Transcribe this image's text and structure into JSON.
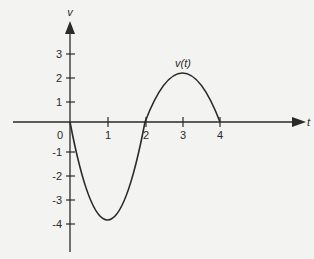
{
  "chart_data": {
    "type": "line",
    "title": "",
    "xlabel": "t",
    "ylabel": "v",
    "curve_label": "v(t)",
    "x_ticks": [
      "1",
      "2",
      "3",
      "4"
    ],
    "y_ticks": [
      "3",
      "2",
      "1",
      "-1",
      "-2",
      "-3",
      "-4"
    ],
    "origin_label": "0",
    "xlim": [
      0,
      5
    ],
    "ylim": [
      -4.5,
      4
    ],
    "grid": false,
    "series": [
      {
        "name": "v(t)",
        "x": [
          0,
          0.25,
          0.5,
          0.75,
          1,
          1.25,
          1.5,
          1.75,
          2,
          2.25,
          2.5,
          2.75,
          3,
          3.25,
          3.5,
          3.75,
          4
        ],
        "values": [
          0,
          -1.75,
          -3.0,
          -3.75,
          -4,
          -3.75,
          -3.0,
          -1.75,
          0,
          1.0,
          1.6,
          1.9,
          2,
          1.9,
          1.6,
          1.0,
          0
        ]
      }
    ],
    "key_points": [
      {
        "t": 0,
        "v": 0
      },
      {
        "t": 1,
        "v": -4
      },
      {
        "t": 2,
        "v": 0
      },
      {
        "t": 3,
        "v": 2
      },
      {
        "t": 4,
        "v": 0
      }
    ]
  }
}
